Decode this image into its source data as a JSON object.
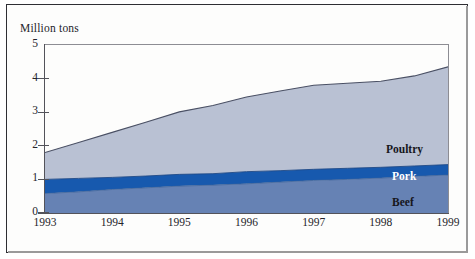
{
  "figure": {
    "axis_title": "Million tons"
  },
  "chart_data": {
    "type": "area",
    "stacked": true,
    "title": "",
    "subtitle": "",
    "xlabel": "",
    "ylabel": "Million tons",
    "xlim": [
      1993,
      1999
    ],
    "ylim": [
      0,
      5
    ],
    "grid": false,
    "legend_position": "in-plot-right",
    "x": [
      1993,
      1993.5,
      1994,
      1994.5,
      1995,
      1995.5,
      1996,
      1996.5,
      1997,
      1997.5,
      1998,
      1998.5,
      1999
    ],
    "xticks": [
      1993,
      1994,
      1995,
      1996,
      1997,
      1998,
      1999
    ],
    "xtick_labels": [
      "1993",
      "1994",
      "1995",
      "1996",
      "1997",
      "1998",
      "1999"
    ],
    "yticks": [
      0,
      1,
      2,
      3,
      4,
      5
    ],
    "ytick_labels": [
      "0",
      "1",
      "2",
      "3",
      "4",
      "5"
    ],
    "series": [
      {
        "name": "Beef",
        "color": "#6682b4",
        "label_color": "#16161c",
        "values": [
          0.58,
          0.63,
          0.7,
          0.75,
          0.8,
          0.83,
          0.87,
          0.92,
          0.97,
          1.0,
          1.04,
          1.09,
          1.13
        ]
      },
      {
        "name": "Pork",
        "color": "#1759ae",
        "label_color": "#ffffff",
        "values": [
          0.42,
          0.4,
          0.36,
          0.35,
          0.35,
          0.34,
          0.36,
          0.34,
          0.33,
          0.33,
          0.32,
          0.31,
          0.31
        ]
      },
      {
        "name": "Poultry",
        "color": "#b9c1d3",
        "label_color": "#16161c",
        "values": [
          0.8,
          1.07,
          1.34,
          1.6,
          1.86,
          2.03,
          2.22,
          2.37,
          2.5,
          2.53,
          2.56,
          2.68,
          2.91
        ]
      }
    ],
    "cumulative_totals": [
      1.8,
      2.1,
      2.4,
      2.7,
      3.01,
      3.2,
      3.45,
      3.63,
      3.8,
      3.86,
      3.92,
      4.08,
      4.35
    ],
    "series_labels": [
      {
        "name": "Poultry",
        "text": "Poultry"
      },
      {
        "name": "Pork",
        "text": "Pork"
      },
      {
        "name": "Beef",
        "text": "Beef"
      }
    ]
  },
  "colors": {
    "poultry": "#b9c1d3",
    "pork": "#1759ae",
    "beef": "#6682b4",
    "axis": "#53535a",
    "outline": "#4a5064",
    "frame": "#2e2e33",
    "background": "#fdfdfc"
  }
}
